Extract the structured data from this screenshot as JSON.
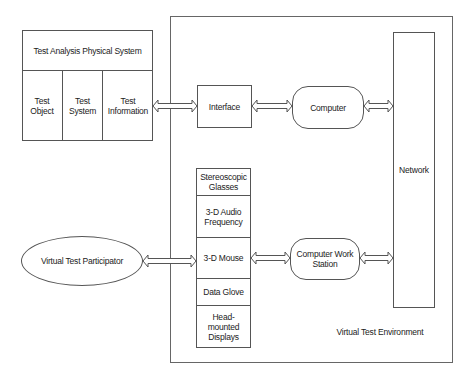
{
  "diagram": {
    "physical_system": {
      "title": "Test Analysis Physical System",
      "columns": [
        {
          "label": "Test\nObject"
        },
        {
          "label": "Test\nSystem"
        },
        {
          "label": "Test\nInformation"
        }
      ]
    },
    "environment": {
      "label": "Virtual Test Environment",
      "interface": "Interface",
      "computer": "Computer",
      "network": "Network",
      "workstation": "Computer Work\nStation",
      "devices": [
        {
          "label": "Stereoscopic\nGlasses"
        },
        {
          "label": "3-D  Audio\nFrequency"
        },
        {
          "label": "3-D Mouse"
        },
        {
          "label": "Data Glove"
        },
        {
          "label": "Head-\nmounted\nDisplays"
        }
      ]
    },
    "participant": "Virtual Test Participator",
    "connections": [
      {
        "from": "Test Information",
        "to": "Interface",
        "type": "bidirectional"
      },
      {
        "from": "Interface",
        "to": "Computer",
        "type": "bidirectional"
      },
      {
        "from": "Computer",
        "to": "Network",
        "type": "bidirectional"
      },
      {
        "from": "Virtual Test Participator",
        "to": "3-D Mouse",
        "type": "bidirectional"
      },
      {
        "from": "3-D Mouse",
        "to": "Computer Work Station",
        "type": "bidirectional"
      },
      {
        "from": "Computer Work Station",
        "to": "Network",
        "type": "bidirectional"
      }
    ],
    "colors": {
      "line": "#555555",
      "text": "#222222",
      "background": "#ffffff"
    }
  }
}
